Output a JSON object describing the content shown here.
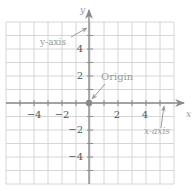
{
  "diagram": {
    "grid": {
      "x_min": -6,
      "x_max": 6,
      "y_min": -6,
      "y_max": 6,
      "step": 1,
      "left_px": 6,
      "top_px": 22,
      "cell_w": 14,
      "cell_h": 13.5,
      "line_color": "#d6d6d6"
    },
    "axes": {
      "color": "#8a8a8a",
      "x_label": "x",
      "y_label": "y",
      "x_tick_labels": [
        {
          "value": -4,
          "text": "−4"
        },
        {
          "value": -2,
          "text": "−2"
        },
        {
          "value": 2,
          "text": "2"
        },
        {
          "value": 4,
          "text": "4"
        }
      ],
      "y_tick_labels": [
        {
          "value": 4,
          "text": "4"
        },
        {
          "value": 2,
          "text": "2"
        },
        {
          "value": -2,
          "text": "−2"
        },
        {
          "value": -4,
          "text": "−4"
        }
      ]
    },
    "origin": {
      "label": "Origin",
      "dot_color": "#8a8a8a"
    },
    "annotations": {
      "y_axis_label": "y-axis",
      "x_axis_label": "x-axis",
      "origin_label": "Origin"
    },
    "colors": {
      "label_text": "#9a9a9a",
      "tick_text": "#555555",
      "arrow": "#9a9a9a"
    }
  }
}
